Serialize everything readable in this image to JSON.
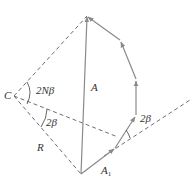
{
  "diagram": {
    "colors": {
      "solid_line": "#8a8a8a",
      "dashed_line": "#6e6e6e",
      "text": "#333333",
      "background": "#ffffff"
    },
    "points": {
      "C": [
        14,
        96
      ],
      "apex": [
        87,
        16
      ],
      "P1": [
        120,
        40
      ],
      "P2": [
        136,
        79
      ],
      "P3": [
        136,
        115
      ],
      "P4": [
        115,
        148
      ],
      "bottom": [
        81,
        174
      ],
      "ray_end": [
        190,
        100
      ]
    },
    "labels": {
      "C": "C",
      "angle_2Nbeta": "2Nβ",
      "A": "A",
      "angle_2beta_left": "2β",
      "R": "R",
      "A1_main": "A",
      "A1_sub": "1",
      "angle_2beta_right": "2β"
    }
  }
}
